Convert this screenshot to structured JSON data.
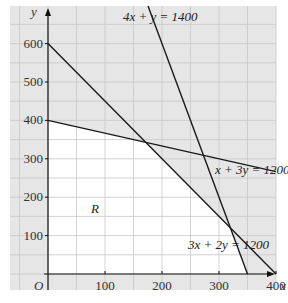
{
  "chart_data": {
    "type": "line",
    "title": "",
    "xlabel": "x",
    "ylabel": "y",
    "origin_label": "O",
    "region_label": "R",
    "xlim": [
      0,
      575
    ],
    "ylim": [
      0,
      650
    ],
    "grid": true,
    "grid_step": 50,
    "x_ticks": [
      100,
      200,
      300,
      400,
      500
    ],
    "y_ticks": [
      100,
      200,
      300,
      400,
      500,
      600
    ],
    "series": [
      {
        "name": "4x + y = 1400",
        "points": [
          [
            287.5,
            250
          ],
          [
            350,
            0
          ]
        ],
        "label": "4x + y = 1400",
        "a": 4,
        "b": 1,
        "c": 1400
      },
      {
        "name": "x + 3y = 1200",
        "points": [
          [
            0,
            400
          ],
          [
            575,
            208.3
          ]
        ],
        "label": "x + 3y = 1200",
        "a": 1,
        "b": 3,
        "c": 1200
      },
      {
        "name": "3x + 2y = 1200",
        "points": [
          [
            0,
            600
          ],
          [
            400,
            0
          ]
        ],
        "label": "3x + 2y = 1200",
        "a": 3,
        "b": 2,
        "c": 1200
      }
    ],
    "feasible_region": {
      "label": "R",
      "vertices": [
        [
          0,
          0
        ],
        [
          0,
          400
        ],
        [
          171.4,
          342.9
        ],
        [
          320,
          120
        ],
        [
          350,
          0
        ]
      ]
    },
    "colors": {
      "shade": "#e6e6e6",
      "grid": "#c8c8c8",
      "line": "#1a1a1a",
      "region": "#ffffff"
    }
  }
}
